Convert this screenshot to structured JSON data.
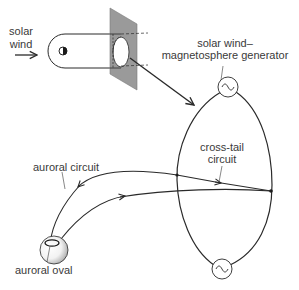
{
  "diagram": {
    "labels": {
      "solar_wind_line1": "solar",
      "solar_wind_line2": "wind",
      "generator_line1": "solar wind–",
      "generator_line2": "magnetosphere generator",
      "cross_tail_line1": "cross-tail",
      "cross_tail_line2": "circuit",
      "auroral_circuit": "auroral circuit",
      "auroral_oval": "auroral oval"
    },
    "icons": {
      "top_generator": "ac-source-icon",
      "bottom_generator": "ac-source-icon",
      "earth_small": "earth-half-shaded-icon",
      "earth_large": "earth-sphere-icon"
    },
    "colors": {
      "line": "#2a2a2a",
      "plane_fill": "#9a9a9a",
      "text": "#3a3a3a",
      "sphere_shade": "#a8a8a8"
    }
  }
}
